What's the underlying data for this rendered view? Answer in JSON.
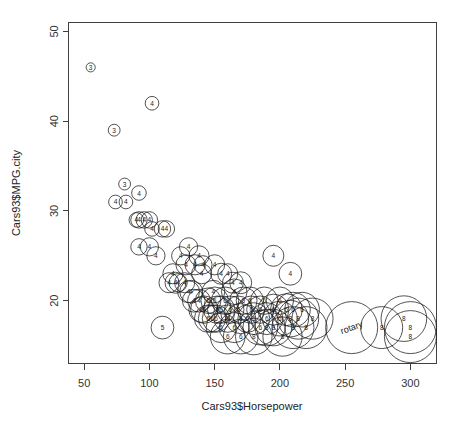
{
  "chart_data": {
    "type": "scatter",
    "title": "",
    "subtitle": "",
    "xlabel": "Cars93$Horsepower",
    "ylabel": "Cars93$MPG.city",
    "xlim": [
      38,
      320
    ],
    "ylim": [
      13,
      51
    ],
    "xticks": [
      50,
      100,
      150,
      200,
      250,
      300
    ],
    "yticks": [
      20,
      30,
      40,
      50
    ],
    "grid": false,
    "legend": null,
    "marker_style": "open-circle-sized-by-engine-size",
    "marker_label_field": "Cylinders",
    "series": [
      {
        "name": "Cars93",
        "x_field": "Horsepower",
        "y_field": "MPG.city",
        "size_field": "EngineSize",
        "label_field": "Cylinders",
        "points": [
          {
            "x": 55,
            "y": 46,
            "r": 1.0,
            "label": "3"
          },
          {
            "x": 73,
            "y": 39,
            "r": 1.3,
            "label": "3"
          },
          {
            "x": 102,
            "y": 42,
            "r": 1.5,
            "label": "4"
          },
          {
            "x": 81,
            "y": 33,
            "r": 1.3,
            "label": "3"
          },
          {
            "x": 74,
            "y": 31,
            "r": 1.5,
            "label": "4"
          },
          {
            "x": 82,
            "y": 31,
            "r": 1.5,
            "label": "4"
          },
          {
            "x": 92,
            "y": 32,
            "r": 1.6,
            "label": "4"
          },
          {
            "x": 90,
            "y": 29,
            "r": 1.6,
            "label": "4"
          },
          {
            "x": 92,
            "y": 29,
            "r": 1.8,
            "label": "4"
          },
          {
            "x": 96,
            "y": 29,
            "r": 1.8,
            "label": "4"
          },
          {
            "x": 100,
            "y": 29,
            "r": 1.8,
            "label": "4"
          },
          {
            "x": 102,
            "y": 28,
            "r": 1.6,
            "label": "4"
          },
          {
            "x": 110,
            "y": 28,
            "r": 1.8,
            "label": "4"
          },
          {
            "x": 113,
            "y": 28,
            "r": 1.8,
            "label": "4"
          },
          {
            "x": 92,
            "y": 26,
            "r": 1.8,
            "label": "4"
          },
          {
            "x": 100,
            "y": 26,
            "r": 2.0,
            "label": "4"
          },
          {
            "x": 105,
            "y": 25,
            "r": 2.0,
            "label": "4"
          },
          {
            "x": 124,
            "y": 25,
            "r": 2.0,
            "label": "4"
          },
          {
            "x": 128,
            "y": 24,
            "r": 2.2,
            "label": "4"
          },
          {
            "x": 130,
            "y": 26,
            "r": 2.0,
            "label": "4"
          },
          {
            "x": 135,
            "y": 24,
            "r": 2.2,
            "label": "4"
          },
          {
            "x": 138,
            "y": 25,
            "r": 2.2,
            "label": "4"
          },
          {
            "x": 140,
            "y": 23,
            "r": 2.2,
            "label": "4"
          },
          {
            "x": 141,
            "y": 24,
            "r": 2.0,
            "label": "4"
          },
          {
            "x": 150,
            "y": 24,
            "r": 2.2,
            "label": "4"
          },
          {
            "x": 155,
            "y": 23,
            "r": 2.3,
            "label": "4"
          },
          {
            "x": 160,
            "y": 23,
            "r": 2.2,
            "label": "4"
          },
          {
            "x": 164,
            "y": 22,
            "r": 2.3,
            "label": "4"
          },
          {
            "x": 170,
            "y": 22,
            "r": 2.4,
            "label": "4"
          },
          {
            "x": 195,
            "y": 25,
            "r": 2.3,
            "label": "4"
          },
          {
            "x": 208,
            "y": 23,
            "r": 2.5,
            "label": "4"
          },
          {
            "x": 110,
            "y": 17,
            "r": 2.5,
            "label": "5"
          },
          {
            "x": 115,
            "y": 22,
            "r": 2.2,
            "label": "4"
          },
          {
            "x": 118,
            "y": 23,
            "r": 2.2,
            "label": "4"
          },
          {
            "x": 120,
            "y": 22,
            "r": 2.3,
            "label": "4"
          },
          {
            "x": 122,
            "y": 22,
            "r": 2.0,
            "label": "4"
          },
          {
            "x": 127,
            "y": 22,
            "r": 2.2,
            "label": "4"
          },
          {
            "x": 130,
            "y": 21,
            "r": 2.4,
            "label": "4"
          },
          {
            "x": 132,
            "y": 21,
            "r": 2.5,
            "label": "4"
          },
          {
            "x": 134,
            "y": 20,
            "r": 2.5,
            "label": "4"
          },
          {
            "x": 138,
            "y": 20,
            "r": 2.5,
            "label": "4"
          },
          {
            "x": 140,
            "y": 19,
            "r": 2.8,
            "label": "6"
          },
          {
            "x": 142,
            "y": 19,
            "r": 3.0,
            "label": "6"
          },
          {
            "x": 145,
            "y": 20,
            "r": 2.8,
            "label": "6"
          },
          {
            "x": 145,
            "y": 18,
            "r": 3.0,
            "label": "6"
          },
          {
            "x": 148,
            "y": 18,
            "r": 3.0,
            "label": "6"
          },
          {
            "x": 149,
            "y": 21,
            "r": 2.5,
            "label": "4"
          },
          {
            "x": 150,
            "y": 20,
            "r": 3.0,
            "label": "6"
          },
          {
            "x": 151,
            "y": 18,
            "r": 3.0,
            "label": "6"
          },
          {
            "x": 152,
            "y": 19,
            "r": 3.0,
            "label": "6"
          },
          {
            "x": 155,
            "y": 19,
            "r": 3.0,
            "label": "6"
          },
          {
            "x": 155,
            "y": 17,
            "r": 3.3,
            "label": "6"
          },
          {
            "x": 158,
            "y": 20,
            "r": 3.0,
            "label": "6"
          },
          {
            "x": 160,
            "y": 18,
            "r": 3.0,
            "label": "6"
          },
          {
            "x": 160,
            "y": 16,
            "r": 3.8,
            "label": "6"
          },
          {
            "x": 162,
            "y": 19,
            "r": 3.0,
            "label": "6"
          },
          {
            "x": 165,
            "y": 21,
            "r": 2.8,
            "label": "4"
          },
          {
            "x": 165,
            "y": 17,
            "r": 3.3,
            "label": "6"
          },
          {
            "x": 168,
            "y": 19,
            "r": 3.0,
            "label": "6"
          },
          {
            "x": 170,
            "y": 18,
            "r": 3.3,
            "label": "6"
          },
          {
            "x": 170,
            "y": 16,
            "r": 3.8,
            "label": "6"
          },
          {
            "x": 172,
            "y": 20,
            "r": 3.0,
            "label": "6"
          },
          {
            "x": 175,
            "y": 18,
            "r": 3.0,
            "label": "6"
          },
          {
            "x": 177,
            "y": 20,
            "r": 3.0,
            "label": "6"
          },
          {
            "x": 178,
            "y": 19,
            "r": 3.0,
            "label": "6"
          },
          {
            "x": 180,
            "y": 18,
            "r": 3.5,
            "label": "6"
          },
          {
            "x": 180,
            "y": 16,
            "r": 4.0,
            "label": "8"
          },
          {
            "x": 185,
            "y": 19,
            "r": 3.0,
            "label": "6"
          },
          {
            "x": 185,
            "y": 17,
            "r": 3.8,
            "label": "6"
          },
          {
            "x": 188,
            "y": 20,
            "r": 3.0,
            "label": "6"
          },
          {
            "x": 190,
            "y": 18,
            "r": 3.5,
            "label": "6"
          },
          {
            "x": 190,
            "y": 17,
            "r": 4.0,
            "label": "8"
          },
          {
            "x": 195,
            "y": 19,
            "r": 3.4,
            "label": "6"
          },
          {
            "x": 195,
            "y": 17,
            "r": 4.0,
            "label": "8"
          },
          {
            "x": 200,
            "y": 18,
            "r": 3.8,
            "label": "6"
          },
          {
            "x": 200,
            "y": 20,
            "r": 3.0,
            "label": "6"
          },
          {
            "x": 202,
            "y": 16,
            "r": 4.3,
            "label": "8"
          },
          {
            "x": 205,
            "y": 19,
            "r": 3.5,
            "label": "6"
          },
          {
            "x": 208,
            "y": 18,
            "r": 4.0,
            "label": "8"
          },
          {
            "x": 210,
            "y": 17,
            "r": 4.6,
            "label": "8"
          },
          {
            "x": 210,
            "y": 19,
            "r": 3.8,
            "label": "6"
          },
          {
            "x": 214,
            "y": 18,
            "r": 4.5,
            "label": "8"
          },
          {
            "x": 217,
            "y": 19,
            "r": 3.8,
            "label": "6"
          },
          {
            "x": 220,
            "y": 17,
            "r": 4.6,
            "label": "8"
          },
          {
            "x": 225,
            "y": 18,
            "r": 4.5,
            "label": "8"
          },
          {
            "x": 255,
            "y": 17,
            "r": 5.7,
            "label": "rotary"
          },
          {
            "x": 278,
            "y": 17,
            "r": 4.6,
            "label": "8"
          },
          {
            "x": 295,
            "y": 18,
            "r": 5.0,
            "label": "8"
          },
          {
            "x": 300,
            "y": 17,
            "r": 5.7,
            "label": "8"
          },
          {
            "x": 300,
            "y": 16,
            "r": 5.7,
            "label": "8"
          }
        ]
      }
    ]
  },
  "axes": {
    "x": {
      "title": "Cars93$Horsepower",
      "tick_labels": [
        "50",
        "100",
        "150",
        "200",
        "250",
        "300"
      ]
    },
    "y": {
      "title": "Cars93$MPG.city",
      "tick_labels": [
        "20",
        "30",
        "40",
        "50"
      ]
    }
  },
  "colors": {
    "background": "#ffffff",
    "axis": "#404040",
    "marker_stroke": "#1a1a1a",
    "text": "#222222"
  }
}
